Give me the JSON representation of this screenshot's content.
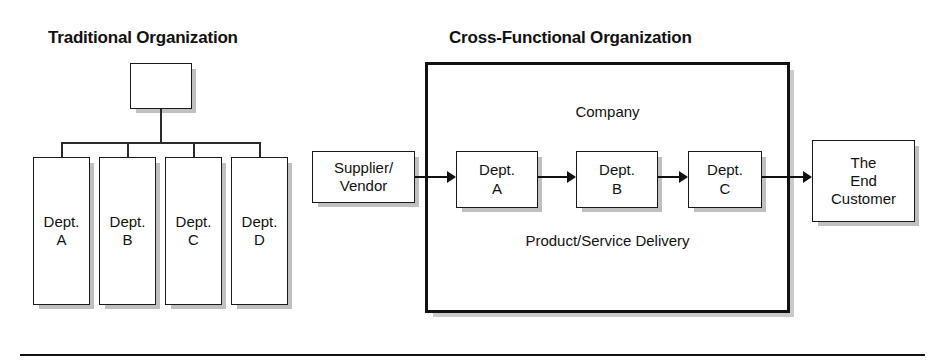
{
  "figure": {
    "width": 945,
    "height": 362,
    "background": "#ffffff",
    "line_color": "#111111"
  },
  "left_diagram": {
    "title": "Traditional Organization",
    "top_node_label": "",
    "departments": [
      {
        "line1": "Dept.",
        "line2": "A"
      },
      {
        "line1": "Dept.",
        "line2": "B"
      },
      {
        "line1": "Dept.",
        "line2": "C"
      },
      {
        "line1": "Dept.",
        "line2": "D"
      }
    ]
  },
  "right_diagram": {
    "title": "Cross-Functional Organization",
    "container_label": "Company",
    "flow_label": "Product/Service Delivery",
    "supplier": {
      "line1": "Supplier/",
      "line2": "Vendor"
    },
    "departments": [
      {
        "line1": "Dept.",
        "line2": "A"
      },
      {
        "line1": "Dept.",
        "line2": "B"
      },
      {
        "line1": "Dept.",
        "line2": "C"
      }
    ],
    "customer": {
      "line1": "The",
      "line2": "End",
      "line3": "Customer"
    }
  }
}
